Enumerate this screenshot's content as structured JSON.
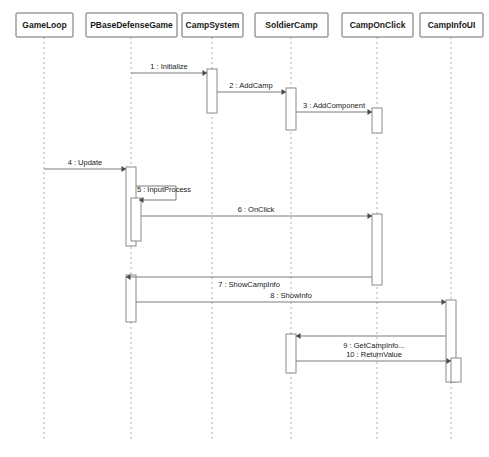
{
  "diagram": {
    "type": "uml-sequence-diagram",
    "title": "",
    "canvas": {
      "width": 489,
      "height": 457
    },
    "colors": {
      "background": "#ffffff",
      "box_stroke": "#6b6b6b",
      "lifeline_stroke": "#b0b0b0",
      "activation_stroke": "#8a8a8a",
      "message_stroke": "#7a7a7a",
      "text": "#1a1a1a"
    },
    "lifelines": [
      {
        "id": "gameloop",
        "label": "GameLoop",
        "x": 44,
        "box_x": 16,
        "box_y": 13,
        "box_w": 57,
        "box_h": 24,
        "dash_top": 37,
        "dash_bottom": 440
      },
      {
        "id": "pbase",
        "label": "PBaseDefenseGame",
        "x": 131,
        "box_x": 86,
        "box_y": 13,
        "box_w": 91,
        "box_h": 24,
        "dash_top": 37,
        "dash_bottom": 440
      },
      {
        "id": "campsystem",
        "label": "CampSystem",
        "x": 212,
        "box_x": 182,
        "box_y": 13,
        "box_w": 61,
        "box_h": 24,
        "dash_top": 37,
        "dash_bottom": 440
      },
      {
        "id": "soldier",
        "label": "SoldierCamp",
        "x": 291,
        "box_x": 255,
        "box_y": 13,
        "box_w": 73,
        "box_h": 24,
        "dash_top": 37,
        "dash_bottom": 440
      },
      {
        "id": "camponclick",
        "label": "CampOnClick",
        "x": 377,
        "box_x": 342,
        "box_y": 13,
        "box_w": 71,
        "box_h": 24,
        "dash_top": 37,
        "dash_bottom": 440
      },
      {
        "id": "campinfoui",
        "label": "CampInfoUI",
        "x": 451,
        "box_x": 420,
        "box_y": 13,
        "box_w": 63,
        "box_h": 24,
        "dash_top": 37,
        "dash_bottom": 440
      }
    ],
    "activations": [
      {
        "id": "act-campsystem-1",
        "lifeline": "campsystem",
        "x": 207,
        "y": 69,
        "w": 10,
        "h": 44
      },
      {
        "id": "act-soldier-1",
        "lifeline": "soldier",
        "x": 286,
        "y": 88,
        "w": 10,
        "h": 42
      },
      {
        "id": "act-camponclick-1",
        "lifeline": "camponclick",
        "x": 372,
        "y": 108,
        "w": 10,
        "h": 25
      },
      {
        "id": "act-pbase-outer",
        "lifeline": "pbase",
        "x": 126,
        "y": 167,
        "w": 10,
        "h": 79
      },
      {
        "id": "act-pbase-inner",
        "lifeline": "pbase",
        "x": 131,
        "y": 198,
        "w": 10,
        "h": 43
      },
      {
        "id": "act-camponclick-2",
        "lifeline": "camponclick",
        "x": 372,
        "y": 214,
        "w": 10,
        "h": 71
      },
      {
        "id": "act-pbase-2",
        "lifeline": "pbase",
        "x": 126,
        "y": 275,
        "w": 10,
        "h": 47
      },
      {
        "id": "act-campinfoui-1",
        "lifeline": "campinfoui",
        "x": 446,
        "y": 300,
        "w": 10,
        "h": 82
      },
      {
        "id": "act-soldier-2",
        "lifeline": "soldier",
        "x": 286,
        "y": 334,
        "w": 10,
        "h": 39
      },
      {
        "id": "act-campinfoui-2",
        "lifeline": "campinfoui",
        "x": 451,
        "y": 358,
        "w": 10,
        "h": 24
      }
    ],
    "messages": [
      {
        "seq": "1",
        "label": "1 : Initialize",
        "from": "pbase",
        "to": "campsystem",
        "x1": 131,
        "x2": 207,
        "y": 73,
        "label_x": 169,
        "label_y": 69,
        "direction": "right",
        "self": false
      },
      {
        "seq": "2",
        "label": "2 : AddCamp",
        "from": "campsystem",
        "to": "soldier",
        "x1": 217,
        "x2": 286,
        "y": 92,
        "label_x": 251,
        "label_y": 88,
        "direction": "right",
        "self": false
      },
      {
        "seq": "3",
        "label": "3 : AddComponent",
        "from": "soldier",
        "to": "camponclick",
        "x1": 296,
        "x2": 372,
        "y": 112,
        "label_x": 334,
        "label_y": 108,
        "direction": "right",
        "self": false
      },
      {
        "seq": "4",
        "label": "4 : Update",
        "from": "gameloop",
        "to": "pbase",
        "x1": 44,
        "x2": 126,
        "y": 169,
        "label_x": 85,
        "label_y": 165,
        "direction": "right",
        "self": false
      },
      {
        "seq": "5",
        "label": "5 : InputProcess",
        "from": "pbase",
        "to": "pbase",
        "x1": 136,
        "x2": 176,
        "y": 186,
        "y2": 200,
        "label_x": 164,
        "label_y": 192,
        "direction": "self",
        "self": true
      },
      {
        "seq": "6",
        "label": "6 : OnClick",
        "from": "pbase",
        "to": "camponclick",
        "x1": 141,
        "x2": 372,
        "y": 216,
        "label_x": 256,
        "label_y": 212,
        "direction": "right",
        "self": false
      },
      {
        "seq": "7",
        "label": "7 : ShowCampInfo",
        "from": "camponclick",
        "to": "pbase",
        "x1": 372,
        "x2": 126,
        "y": 277,
        "label_x": 249,
        "label_y": 287,
        "direction": "left",
        "self": false
      },
      {
        "seq": "8",
        "label": "8 : ShowInfo",
        "from": "pbase",
        "to": "campinfoui",
        "x1": 136,
        "x2": 446,
        "y": 302,
        "label_x": 291,
        "label_y": 298,
        "direction": "right",
        "self": false
      },
      {
        "seq": "9",
        "label": "9 : GetCampInfo...",
        "from": "campinfoui",
        "to": "soldier",
        "x1": 446,
        "x2": 296,
        "y": 336,
        "label_x": 374,
        "label_y": 348,
        "direction": "left",
        "self": false
      },
      {
        "seq": "10",
        "label": "10 : ReturnValue",
        "from": "soldier",
        "to": "campinfoui",
        "x1": 296,
        "x2": 451,
        "y": 361,
        "label_x": 374,
        "label_y": 357,
        "direction": "right",
        "self": false
      }
    ]
  }
}
